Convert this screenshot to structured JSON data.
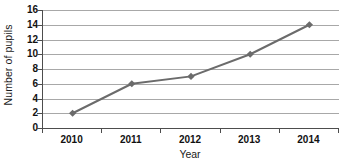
{
  "chart_data": {
    "type": "line",
    "title": "",
    "xlabel": "Year",
    "ylabel": "Number of pupils",
    "categories": [
      "2010",
      "2011",
      "2012",
      "2013",
      "2014"
    ],
    "values": [
      2,
      6,
      7,
      10,
      14
    ],
    "series": [
      {
        "name": "Number of pupils",
        "values": [
          2,
          6,
          7,
          10,
          14
        ]
      }
    ],
    "ylim": [
      0,
      16
    ],
    "y_ticks": [
      0,
      2,
      4,
      6,
      8,
      10,
      12,
      14,
      16
    ],
    "y_tick_labels": [
      "0",
      "2",
      "4",
      "6",
      "8",
      "10",
      "12",
      "14",
      "16"
    ],
    "grid": true,
    "grid_axis": "y",
    "legend": false,
    "legend_position": "none",
    "marker": "diamond",
    "annotations": []
  },
  "style": {
    "series_color": "#6b6b6b",
    "marker_color": "#6b6b6b",
    "gridline_color": "#a8a8a8",
    "axis_color": "#4d4d4d",
    "text_color": "#111111",
    "background": "#ffffff"
  }
}
